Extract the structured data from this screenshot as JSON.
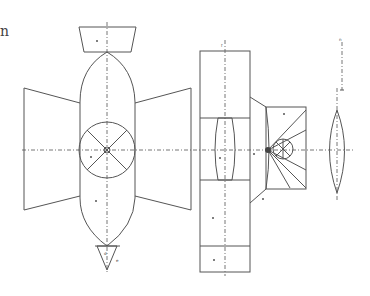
{
  "figure": {
    "type": "technical-drawing",
    "corner_fragment": "n",
    "stroke_color": "#555555",
    "background": "#ffffff",
    "parts": [
      {
        "id": "left-body",
        "label": "a"
      },
      {
        "id": "left-body-lower",
        "label": "b"
      },
      {
        "id": "left-hub",
        "label": "c"
      },
      {
        "id": "left-tail",
        "label": "d"
      },
      {
        "id": "left-tail-tip",
        "label": "e"
      },
      {
        "id": "middle-top",
        "label": "f"
      },
      {
        "id": "middle-lens",
        "label": "g"
      },
      {
        "id": "middle-lower",
        "label": "h"
      },
      {
        "id": "middle-bottom",
        "label": "i"
      },
      {
        "id": "connector",
        "label": "k"
      },
      {
        "id": "fan-box",
        "label": "l"
      },
      {
        "id": "fan-link",
        "label": "m"
      },
      {
        "id": "scale-bar",
        "label": "n"
      }
    ]
  }
}
